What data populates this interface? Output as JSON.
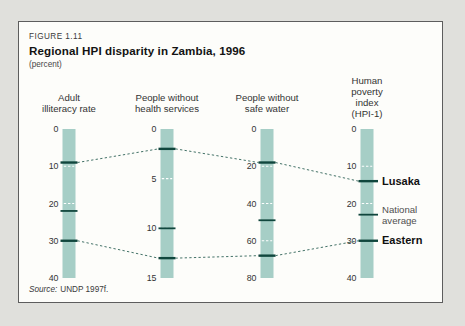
{
  "figure": {
    "label": "FIGURE 1.11",
    "title": "Regional HPI disparity in Zambia, 1996",
    "subtitle": "(percent)",
    "source_prefix": "Source:",
    "source_text": "UNDP 1997f."
  },
  "colors": {
    "page_bg": "#e0e0dc",
    "box_bg": "#fdfdfa",
    "box_border": "#5d5d5d",
    "bar": "#a6cec6",
    "bar_tick_dash": "#ffffff",
    "data_mark": "#10463d",
    "connector": "#2f6257",
    "axis_text": "#333333",
    "bold_label": "#101010",
    "gray_label": "#4f4f4f"
  },
  "chart_data": {
    "type": "line",
    "subtype": "parallel-coordinates",
    "title": "Regional HPI disparity in Zambia, 1996",
    "unit": "percent",
    "legend_position": "right-of-last-axis",
    "axes": [
      {
        "id": "adult-illiteracy-rate",
        "title_lines": [
          "Adult",
          "illiteracy rate"
        ],
        "min": 0,
        "max": 40,
        "ticks": [
          0,
          10,
          20,
          30,
          40
        ]
      },
      {
        "id": "people-without-health-services",
        "title_lines": [
          "People without",
          "health services"
        ],
        "min": 0,
        "max": 15,
        "ticks": [
          0,
          5,
          10,
          15
        ]
      },
      {
        "id": "people-without-safe-water",
        "title_lines": [
          "People without",
          "safe water"
        ],
        "min": 0,
        "max": 80,
        "ticks": [
          0,
          20,
          40,
          60,
          80
        ]
      },
      {
        "id": "human-poverty-index",
        "title_lines": [
          "Human",
          "poverty",
          "index",
          "(HPI-1)"
        ],
        "min": 0,
        "max": 40,
        "ticks": [
          0,
          10,
          20,
          30,
          40
        ]
      }
    ],
    "series": [
      {
        "name": "Lusaka",
        "label_lines": [
          "Lusaka"
        ],
        "values": [
          9,
          2,
          18,
          14
        ],
        "connected": true,
        "bold": true
      },
      {
        "name": "National average",
        "label_lines": [
          "National",
          "average"
        ],
        "values": [
          22,
          10,
          49,
          23
        ],
        "connected": false,
        "bold": false
      },
      {
        "name": "Eastern",
        "label_lines": [
          "Eastern"
        ],
        "values": [
          30,
          13,
          68,
          30
        ],
        "connected": true,
        "bold": true
      }
    ]
  }
}
